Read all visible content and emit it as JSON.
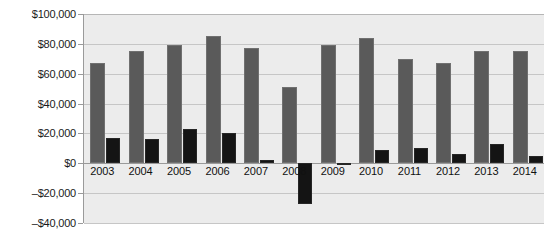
{
  "chart_data": {
    "type": "bar",
    "title": "",
    "xlabel": "",
    "ylabel": "",
    "grid": true,
    "legend": "none",
    "ylim": [
      -40000,
      100000
    ],
    "ytick_step": 20000,
    "ytick_labels": [
      "$100,000",
      "$80,000",
      "$60,000",
      "$40,000",
      "$20,000",
      "$0",
      "–$20,000",
      "–$40,000"
    ],
    "ytick_values": [
      100000,
      80000,
      60000,
      40000,
      20000,
      0,
      -20000,
      -40000
    ],
    "categories": [
      "2003",
      "2004",
      "2005",
      "2006",
      "2007",
      "2008",
      "2009",
      "2010",
      "2011",
      "2012",
      "2013",
      "2014"
    ],
    "series": [
      {
        "name": "series-a",
        "color": "#5a5a5a",
        "values": [
          67000,
          75000,
          79000,
          85000,
          77000,
          51000,
          79000,
          84000,
          70000,
          67000,
          75000,
          75000
        ]
      },
      {
        "name": "series-b",
        "color": "#141414",
        "values": [
          17000,
          16000,
          23000,
          20000,
          2000,
          -27000,
          500,
          9000,
          10000,
          6000,
          13000,
          5000
        ]
      }
    ]
  }
}
